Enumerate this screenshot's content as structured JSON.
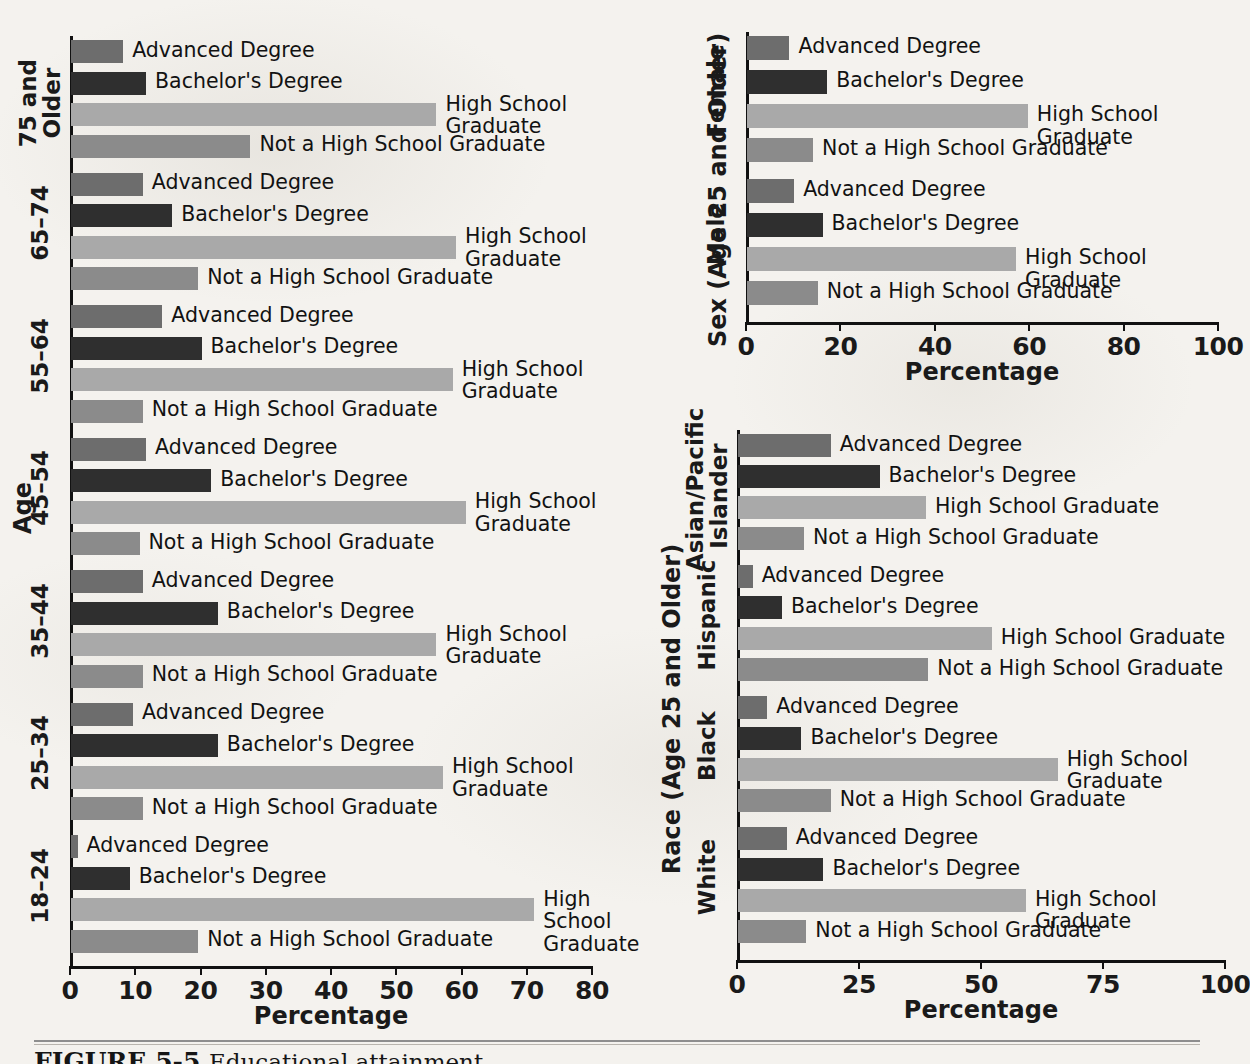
{
  "figure": {
    "caption_label": "FIGURE 5-5",
    "caption_text": "Educational attainment"
  },
  "common": {
    "percentage_axis_title": "Percentage",
    "categories": [
      "Advanced Degree",
      "Bachelor's Degree",
      "High School Graduate",
      "Not a High School Graduate"
    ],
    "category_labels_wrapped": {
      "advanced": "Advanced Degree",
      "bachelors": "Bachelor's Degree",
      "hs_one_line": "High School Graduate",
      "hs_two_line": "High School\nGraduate",
      "not_hs": "Not a High School Graduate"
    },
    "colors": {
      "advanced_degree": "#6d6d6d",
      "bachelors_degree": "#2f2f2f",
      "high_school_graduate": "#a9a9a9",
      "not_high_school_graduate": "#8b8b8b",
      "axis": "#111111",
      "page_background": "#f4f2ee"
    }
  },
  "chart_data": [
    {
      "id": "age-chart",
      "type": "bar",
      "orientation": "horizontal",
      "title": "",
      "ylabel": "Age",
      "xlabel": "Percentage",
      "xlim": [
        0,
        80
      ],
      "xticks": [
        0,
        10,
        20,
        30,
        40,
        50,
        60,
        70,
        80
      ],
      "xticklabels": [
        "0",
        "10",
        "20",
        "30",
        "40",
        "50",
        "60",
        "70",
        "80"
      ],
      "grid": false,
      "legend": "none (bars labeled directly)",
      "categories": [
        "18–24",
        "25–34",
        "35–44",
        "45–54",
        "55–64",
        "65–74",
        "75 and Older"
      ],
      "series": [
        {
          "name": "Advanced Degree",
          "values": [
            1.0,
            9.5,
            11.0,
            11.5,
            14.0,
            11.0,
            8.0
          ]
        },
        {
          "name": "Bachelor's Degree",
          "values": [
            9.0,
            22.5,
            22.5,
            21.5,
            20.0,
            15.5,
            11.5
          ]
        },
        {
          "name": "High School Graduate",
          "values": [
            71.0,
            57.0,
            56.0,
            60.5,
            58.5,
            59.0,
            56.0
          ]
        },
        {
          "name": "Not a High School Graduate",
          "values": [
            19.5,
            11.0,
            11.0,
            10.5,
            11.0,
            19.5,
            27.5
          ]
        }
      ]
    },
    {
      "id": "sex-chart",
      "type": "bar",
      "orientation": "horizontal",
      "title": "",
      "ylabel": "Sex (Age 25 and Older)",
      "xlabel": "Percentage",
      "xlim": [
        0,
        100
      ],
      "xticks": [
        0,
        20,
        40,
        60,
        80,
        100
      ],
      "xticklabels": [
        "0",
        "20",
        "40",
        "60",
        "80",
        "100"
      ],
      "grid": false,
      "legend": "none (bars labeled directly)",
      "categories": [
        "Male",
        "Female"
      ],
      "series": [
        {
          "name": "Advanced Degree",
          "values": [
            10.0,
            9.0
          ]
        },
        {
          "name": "Bachelor's Degree",
          "values": [
            16.0,
            17.0
          ]
        },
        {
          "name": "High School Graduate",
          "values": [
            57.0,
            59.5
          ]
        },
        {
          "name": "Not a High School Graduate",
          "values": [
            15.0,
            14.0
          ]
        }
      ]
    },
    {
      "id": "race-chart",
      "type": "bar",
      "orientation": "horizontal",
      "title": "",
      "ylabel": "Race (Age 25 and Older)",
      "xlabel": "Percentage",
      "xlim": [
        0,
        100
      ],
      "xticks": [
        0,
        25,
        50,
        75,
        100
      ],
      "xticklabels": [
        "0",
        "25",
        "50",
        "75",
        "100"
      ],
      "grid": false,
      "legend": "none (bars labeled directly)",
      "categories": [
        "White",
        "Black",
        "Hispanic",
        "Asian/Pacific\nIslander"
      ],
      "series": [
        {
          "name": "Advanced Degree",
          "values": [
            10.0,
            6.0,
            3.0,
            19.0
          ]
        },
        {
          "name": "Bachelor's Degree",
          "values": [
            17.5,
            13.0,
            9.0,
            29.0
          ]
        },
        {
          "name": "High School Graduate",
          "values": [
            59.0,
            65.5,
            52.0,
            38.5
          ]
        },
        {
          "name": "Not a High School Graduate",
          "values": [
            14.0,
            19.0,
            39.0,
            13.5
          ]
        }
      ]
    }
  ]
}
